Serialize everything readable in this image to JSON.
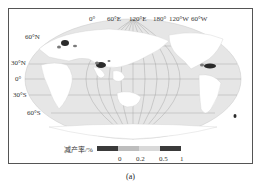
{
  "map": {
    "projection": "Robinson (Pacific-centered)",
    "longitude_labels": [
      "0°",
      "60°E",
      "120°E",
      "180°",
      "120°W",
      "60°W"
    ],
    "latitude_labels": [
      "60°N",
      "30°N",
      "0°",
      "30°S",
      "60°S"
    ],
    "colors": {
      "ocean": "#e6e6e6",
      "land": "#ffffff",
      "grid": "#9a9a9a",
      "hotspot_dark": "#2b2b2b",
      "hotspot_mid": "#7a7a7a"
    }
  },
  "legend": {
    "title": "减产率/%",
    "segments": [
      {
        "color": "#3a3a3a"
      },
      {
        "color": "#bdbdbd"
      },
      {
        "color": "#d9d9d9"
      },
      {
        "color": "#3a3a3a"
      }
    ],
    "ticks": [
      "0",
      "0.2",
      "0.5",
      "1"
    ]
  },
  "caption": "(a)"
}
